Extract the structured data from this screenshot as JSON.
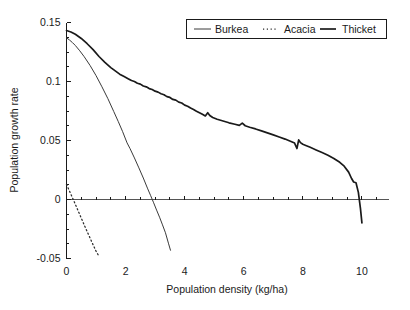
{
  "chart_data": {
    "type": "line",
    "title": "",
    "xlabel": "Population density (kg/ha)",
    "ylabel": "Population growth rate",
    "xlim": [
      0,
      10.9
    ],
    "ylim": [
      -0.05,
      0.15
    ],
    "xticks": [
      0,
      2,
      4,
      6,
      8,
      10
    ],
    "xticklabels": [
      "0",
      "2",
      "4",
      "6",
      "8",
      "10"
    ],
    "yticks": [
      -0.05,
      0,
      0.05,
      0.1,
      0.15
    ],
    "yticklabels": [
      "-0.05",
      "0",
      "0.05",
      "0.1",
      "0.15"
    ],
    "xtick_minor_step": 0.5,
    "ytick_minor_step": 0.0125,
    "grid": false,
    "zero_reference_line": true,
    "legend": {
      "position": "top-right",
      "entries": [
        {
          "name": "Burkea",
          "style": "solid-thin"
        },
        {
          "name": "Acacia",
          "style": "dotted"
        },
        {
          "name": "Thicket",
          "style": "solid-thick"
        }
      ]
    },
    "series": [
      {
        "name": "Burkea",
        "style": "solid-thin",
        "x": [
          0.0,
          0.1,
          0.2,
          0.3,
          0.45,
          0.6,
          0.8,
          1.0,
          1.2,
          1.4,
          1.6,
          1.75,
          1.9,
          2.05,
          2.15,
          2.3,
          2.45,
          2.6,
          2.75,
          2.85,
          2.95,
          3.05,
          3.15,
          3.25,
          3.35,
          3.45,
          3.52
        ],
        "y": [
          0.137,
          0.1352,
          0.133,
          0.1305,
          0.126,
          0.121,
          0.1135,
          0.105,
          0.0955,
          0.0855,
          0.0745,
          0.0662,
          0.0575,
          0.048,
          0.0432,
          0.0352,
          0.0268,
          0.0182,
          0.009,
          0.0032,
          -0.0028,
          -0.009,
          -0.015,
          -0.0215,
          -0.0282,
          -0.037,
          -0.043
        ]
      },
      {
        "name": "Acacia",
        "style": "dotted",
        "x": [
          0.0,
          0.1,
          0.2,
          0.3,
          0.4,
          0.5,
          0.6,
          0.7,
          0.8,
          0.9,
          1.0,
          1.1
        ],
        "y": [
          0.0128,
          0.0072,
          0.0016,
          -0.0042,
          -0.01,
          -0.0158,
          -0.0216,
          -0.0272,
          -0.0328,
          -0.0384,
          -0.0438,
          -0.0482
        ]
      },
      {
        "name": "Thicket",
        "style": "solid-thick",
        "x": [
          0.0,
          0.15,
          0.3,
          0.5,
          0.7,
          0.9,
          1.1,
          1.3,
          1.5,
          1.65,
          1.8,
          1.95,
          2.1,
          2.2,
          2.3,
          2.4,
          2.5,
          2.6,
          2.7,
          2.8,
          2.9,
          3.0,
          3.1,
          3.2,
          3.3,
          3.4,
          3.5,
          3.6,
          3.7,
          3.8,
          3.9,
          4.0,
          4.1,
          4.2,
          4.3,
          4.4,
          4.5,
          4.6,
          4.7,
          4.78,
          4.85,
          4.95,
          5.1,
          5.3,
          5.5,
          5.7,
          5.85,
          5.95,
          6.05,
          6.2,
          6.4,
          6.6,
          6.8,
          7.0,
          7.2,
          7.4,
          7.6,
          7.72,
          7.8,
          7.86,
          7.92,
          8.0,
          8.1,
          8.25,
          8.45,
          8.65,
          8.85,
          9.05,
          9.25,
          9.4,
          9.55,
          9.65,
          9.72,
          9.8,
          9.88,
          9.95,
          10.0
        ],
        "y": [
          0.1432,
          0.142,
          0.14,
          0.1365,
          0.132,
          0.127,
          0.1212,
          0.1162,
          0.1118,
          0.109,
          0.1062,
          0.1042,
          0.1022,
          0.1008,
          0.1,
          0.0985,
          0.0978,
          0.0962,
          0.0955,
          0.094,
          0.0932,
          0.0918,
          0.091,
          0.0896,
          0.0888,
          0.0872,
          0.0865,
          0.0848,
          0.0842,
          0.0825,
          0.0818,
          0.08,
          0.079,
          0.0775,
          0.0762,
          0.0748,
          0.0735,
          0.0722,
          0.0708,
          0.0735,
          0.0712,
          0.0695,
          0.068,
          0.0665,
          0.065,
          0.0638,
          0.0628,
          0.0648,
          0.0625,
          0.0612,
          0.0598,
          0.0582,
          0.0565,
          0.0548,
          0.053,
          0.0512,
          0.0492,
          0.0478,
          0.0432,
          0.0505,
          0.0482,
          0.0468,
          0.0458,
          0.0442,
          0.042,
          0.0398,
          0.0375,
          0.0348,
          0.0315,
          0.0282,
          0.0232,
          0.0178,
          0.0148,
          0.0142,
          0.006,
          -0.0075,
          -0.0198
        ]
      }
    ]
  },
  "axis_labels": {
    "x": "Population density (kg/ha)",
    "y": "Population growth rate"
  }
}
